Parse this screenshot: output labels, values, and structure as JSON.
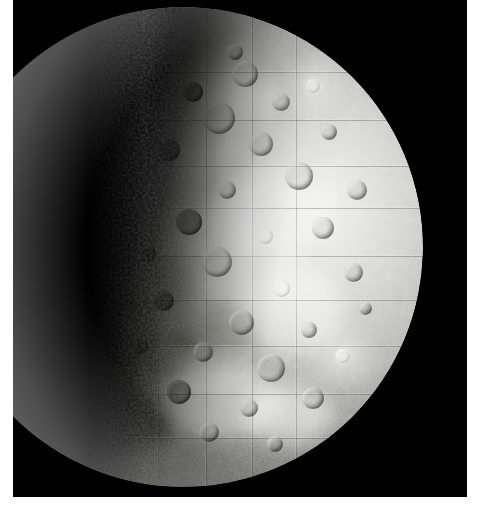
{
  "image": {
    "subject": "Mercury",
    "subject_type": "planet",
    "capture": "photomosaic",
    "view": "gibbous illuminated hemisphere, terminator on the left",
    "canvas": {
      "width": 485,
      "height": 512
    },
    "background_color": "#ffffff",
    "plate": {
      "name": "photographic-plate",
      "color": "#000000",
      "left": 13,
      "top": 0,
      "width": 454,
      "height": 497
    },
    "disc": {
      "name": "planet-disc",
      "center_x": 170,
      "center_y": 247,
      "radius": 240,
      "limb_edge_x": 410,
      "top_y": 10,
      "bottom_y": 485,
      "terminator_x": 158
    },
    "palette": {
      "space_black": "#000000",
      "limb_highlight": "#f2f2f0",
      "midtone_regolith": "#b4b4af",
      "shadow_regolith": "#5f5f5b",
      "terminator_dark": "#0a0a09",
      "border_white": "#ffffff"
    },
    "features": {
      "surface": "heavily cratered regolith",
      "notes": [
        "bright rayed craters",
        "rectangular mosaic frame seams",
        "limb darkening toward terminator",
        "smooth inter-crater plains"
      ]
    },
    "albedo_patches": [
      {
        "left": 30,
        "top": 120,
        "w": 96,
        "h": 58,
        "tone": "dark"
      },
      {
        "left": 96,
        "top": 196,
        "w": 120,
        "h": 64,
        "tone": "dark"
      },
      {
        "left": 150,
        "top": 250,
        "w": 104,
        "h": 62,
        "tone": "dark"
      },
      {
        "left": 232,
        "top": 296,
        "w": 92,
        "h": 54,
        "tone": "dark"
      },
      {
        "left": 186,
        "top": 104,
        "w": 110,
        "h": 66,
        "tone": "light"
      },
      {
        "left": 270,
        "top": 160,
        "w": 118,
        "h": 92,
        "tone": "light"
      },
      {
        "left": 296,
        "top": 258,
        "w": 104,
        "h": 88,
        "tone": "light"
      },
      {
        "left": 214,
        "top": 360,
        "w": 126,
        "h": 70,
        "tone": "light"
      },
      {
        "left": 120,
        "top": 382,
        "w": 110,
        "h": 62,
        "tone": "dark"
      },
      {
        "left": 252,
        "top": 64,
        "w": 86,
        "h": 52,
        "tone": "light"
      },
      {
        "left": 170,
        "top": 320,
        "w": 84,
        "h": 48,
        "tone": "dark"
      },
      {
        "left": 300,
        "top": 380,
        "w": 90,
        "h": 56,
        "tone": "light"
      }
    ],
    "mosaic_seams": {
      "horizontal_y": [
        64,
        112,
        158,
        200,
        248,
        292,
        338,
        386,
        430
      ],
      "vertical_x": [
        118,
        168,
        214,
        262,
        308,
        352
      ],
      "tile_patches": [
        {
          "left": 214,
          "top": 200,
          "w": 100,
          "h": 48,
          "alpha": 0.22,
          "tone": "light"
        },
        {
          "left": 262,
          "top": 248,
          "w": 92,
          "h": 44,
          "alpha": 0.2,
          "tone": "light"
        },
        {
          "left": 168,
          "top": 112,
          "w": 94,
          "h": 46,
          "alpha": 0.16,
          "tone": "dark"
        },
        {
          "left": 118,
          "top": 292,
          "w": 96,
          "h": 46,
          "alpha": 0.18,
          "tone": "dark"
        },
        {
          "left": 308,
          "top": 158,
          "w": 86,
          "h": 42,
          "alpha": 0.18,
          "tone": "light"
        },
        {
          "left": 214,
          "top": 338,
          "w": 94,
          "h": 48,
          "alpha": 0.15,
          "tone": "light"
        }
      ]
    },
    "craters": [
      {
        "x": 232,
        "y": 74,
        "d": 26,
        "kind": "plain"
      },
      {
        "x": 268,
        "y": 102,
        "d": 18,
        "kind": "plain"
      },
      {
        "x": 206,
        "y": 118,
        "d": 32,
        "kind": "plain"
      },
      {
        "x": 300,
        "y": 86,
        "d": 14,
        "kind": "bright"
      },
      {
        "x": 180,
        "y": 92,
        "d": 20,
        "kind": "dark"
      },
      {
        "x": 248,
        "y": 144,
        "d": 24,
        "kind": "plain"
      },
      {
        "x": 316,
        "y": 132,
        "d": 16,
        "kind": "plain"
      },
      {
        "x": 156,
        "y": 150,
        "d": 22,
        "kind": "dark"
      },
      {
        "x": 286,
        "y": 176,
        "d": 28,
        "kind": "plain"
      },
      {
        "x": 214,
        "y": 190,
        "d": 18,
        "kind": "plain"
      },
      {
        "x": 344,
        "y": 190,
        "d": 20,
        "kind": "plain"
      },
      {
        "x": 176,
        "y": 222,
        "d": 26,
        "kind": "dark"
      },
      {
        "x": 252,
        "y": 236,
        "d": 15,
        "kind": "bright"
      },
      {
        "x": 310,
        "y": 228,
        "d": 22,
        "kind": "plain"
      },
      {
        "x": 204,
        "y": 262,
        "d": 30,
        "kind": "plain"
      },
      {
        "x": 268,
        "y": 288,
        "d": 17,
        "kind": "bright"
      },
      {
        "x": 340,
        "y": 272,
        "d": 19,
        "kind": "plain"
      },
      {
        "x": 150,
        "y": 300,
        "d": 21,
        "kind": "dark"
      },
      {
        "x": 228,
        "y": 322,
        "d": 25,
        "kind": "plain"
      },
      {
        "x": 296,
        "y": 330,
        "d": 16,
        "kind": "plain"
      },
      {
        "x": 190,
        "y": 352,
        "d": 20,
        "kind": "plain"
      },
      {
        "x": 258,
        "y": 368,
        "d": 28,
        "kind": "plain"
      },
      {
        "x": 330,
        "y": 356,
        "d": 14,
        "kind": "bright"
      },
      {
        "x": 166,
        "y": 392,
        "d": 24,
        "kind": "dark"
      },
      {
        "x": 236,
        "y": 408,
        "d": 18,
        "kind": "plain"
      },
      {
        "x": 300,
        "y": 398,
        "d": 22,
        "kind": "plain"
      },
      {
        "x": 196,
        "y": 432,
        "d": 20,
        "kind": "plain"
      },
      {
        "x": 262,
        "y": 444,
        "d": 16,
        "kind": "plain"
      },
      {
        "x": 134,
        "y": 254,
        "d": 18,
        "kind": "dark"
      },
      {
        "x": 128,
        "y": 346,
        "d": 16,
        "kind": "dark"
      },
      {
        "x": 352,
        "y": 308,
        "d": 13,
        "kind": "plain"
      },
      {
        "x": 222,
        "y": 52,
        "d": 16,
        "kind": "plain"
      }
    ],
    "rays": [
      {
        "x": 252,
        "y": 236,
        "r": 52
      },
      {
        "x": 268,
        "y": 288,
        "r": 46
      },
      {
        "x": 330,
        "y": 356,
        "r": 40
      },
      {
        "x": 300,
        "y": 86,
        "r": 38
      }
    ]
  }
}
